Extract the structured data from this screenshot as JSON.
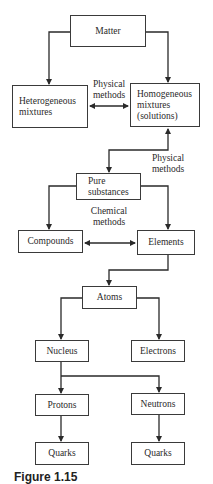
{
  "diagram": {
    "nodes": {
      "matter": "Matter",
      "heterogeneous": "Heterogeneous\nmixtures",
      "homogeneous": "Homogeneous\nmixtures\n(solutions)",
      "pure_substances": "Pure\nsubstances",
      "compounds": "Compounds",
      "elements": "Elements",
      "atoms": "Atoms",
      "nucleus": "Nucleus",
      "electrons": "Electrons",
      "protons": "Protons",
      "neutrons": "Neutrons",
      "quarks_left": "Quarks",
      "quarks_right": "Quarks"
    },
    "edge_labels": {
      "mixtures_separation": "Physical\nmethods",
      "homogeneous_pure": "Physical\nmethods",
      "compounds_elements": "Chemical\nmethods"
    },
    "edges": [
      {
        "from": "matter",
        "to": "heterogeneous",
        "type": "arrow"
      },
      {
        "from": "matter",
        "to": "homogeneous",
        "type": "arrow"
      },
      {
        "from": "heterogeneous",
        "to": "homogeneous",
        "type": "double-arrow",
        "label": "Physical methods"
      },
      {
        "from": "homogeneous",
        "to": "pure_substances",
        "type": "double-arrow",
        "label": "Physical methods"
      },
      {
        "from": "pure_substances",
        "to": "compounds",
        "type": "arrow"
      },
      {
        "from": "pure_substances",
        "to": "elements",
        "type": "arrow"
      },
      {
        "from": "compounds",
        "to": "elements",
        "type": "double-arrow",
        "label": "Chemical methods"
      },
      {
        "from": "elements",
        "to": "atoms",
        "type": "arrow"
      },
      {
        "from": "atoms",
        "to": "nucleus",
        "type": "arrow"
      },
      {
        "from": "atoms",
        "to": "electrons",
        "type": "arrow"
      },
      {
        "from": "nucleus",
        "to": "protons",
        "type": "arrow"
      },
      {
        "from": "nucleus",
        "to": "neutrons",
        "type": "arrow"
      },
      {
        "from": "protons",
        "to": "quarks_left",
        "type": "arrow"
      },
      {
        "from": "neutrons",
        "to": "quarks_right",
        "type": "arrow"
      }
    ],
    "caption_partial": "Figure 1.15"
  }
}
